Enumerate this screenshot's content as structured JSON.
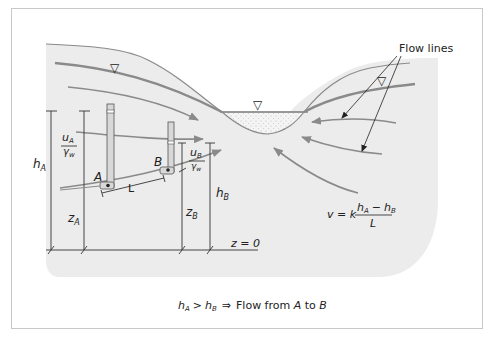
{
  "figure": {
    "title_caption": "h_A > h_B ⇒ Flow from A to B",
    "caption_parts": {
      "lhs_h": "h",
      "lhs_sub": "A",
      "op": ">",
      "rhs_h": "h",
      "rhs_sub": "B",
      "implies": "⇒",
      "text1": "Flow from ",
      "point_a": "A",
      "text2": " to ",
      "point_b": "B"
    },
    "callout": {
      "label": "Flow lines"
    },
    "labels": {
      "hA": "h",
      "hA_sub": "A",
      "hB": "h",
      "hB_sub": "B",
      "zA": "z",
      "zA_sub": "A",
      "zB": "z",
      "zB_sub": "B",
      "uA_num": "u",
      "uA_num_sub": "A",
      "uA_den": "γ",
      "uA_den_sub": "w",
      "uB_num": "u",
      "uB_num_sub": "B",
      "uB_den": "γ",
      "uB_den_sub": "w",
      "pointA": "A",
      "pointB": "B",
      "L": "L",
      "datum": "z = 0"
    },
    "equation": {
      "lhs": "v = k",
      "num_h1": "h",
      "num_sub1": "A",
      "minus": "−",
      "num_h2": "h",
      "num_sub2": "B",
      "den": "L"
    },
    "water_table_symbol": "▽",
    "colors": {
      "ground": "#ececec",
      "lines": "#8a8a8a",
      "ink": "#222222",
      "frame": "#c8c8c8",
      "water": "#f2f2f2"
    }
  }
}
